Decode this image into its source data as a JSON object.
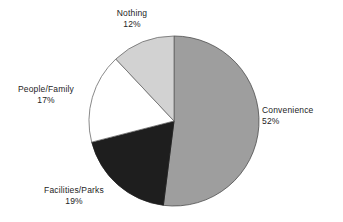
{
  "chart_data": {
    "type": "pie",
    "title": "",
    "subtitle": "",
    "xlabel": "",
    "ylabel": "",
    "legend_position": "none",
    "grid": false,
    "units": "percent",
    "start_angle_deg": 0,
    "direction": "clockwise",
    "categories": [
      "Convenience",
      "Facilities/Parks",
      "People/Family",
      "Nothing"
    ],
    "values": [
      52,
      19,
      17,
      12
    ],
    "slices": [
      {
        "label": "Convenience",
        "value": 52,
        "value_text": "52%",
        "color": "#9e9e9e",
        "stroke": "#4d4d4d",
        "start_deg": 0,
        "end_deg": 187.2
      },
      {
        "label": "Facilities/Parks",
        "value": 19,
        "value_text": "19%",
        "color": "#1e1e1e",
        "stroke": "#1e1e1e",
        "start_deg": 187.2,
        "end_deg": 255.6
      },
      {
        "label": "People/Family",
        "value": 17,
        "value_text": "17%",
        "color": "#ffffff",
        "stroke": "#6b6b6b",
        "start_deg": 255.6,
        "end_deg": 316.8
      },
      {
        "label": "Nothing",
        "value": 12,
        "value_text": "12%",
        "color": "#d2d2d2",
        "stroke": "#6b6b6b",
        "start_deg": 316.8,
        "end_deg": 360
      }
    ]
  },
  "labels": {
    "nothing": {
      "name": "Nothing",
      "value": "12%"
    },
    "convenience": {
      "name": "Convenience",
      "value": "52%"
    },
    "people_family": {
      "name": "People/Family",
      "value": "17%"
    },
    "facilities_parks": {
      "name": "Facilities/Parks",
      "value": "19%"
    }
  },
  "geometry": {
    "center_x": 174,
    "center_y": 121,
    "radius": 85
  },
  "colors": {
    "background": "#ffffff",
    "text": "#242424",
    "convenience": "#9e9e9e",
    "facilities_parks": "#1e1e1e",
    "people_family": "#ffffff",
    "nothing": "#d2d2d2",
    "outline": "#6b6b6b"
  }
}
